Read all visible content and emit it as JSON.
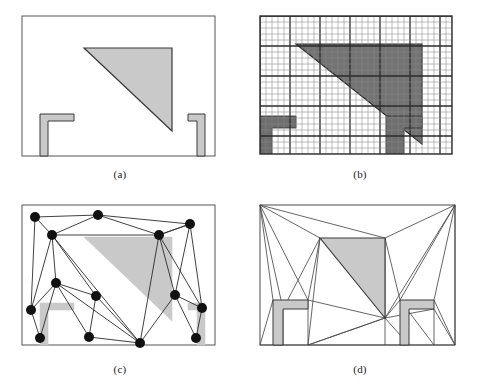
{
  "figure": {
    "background_color": "#ffffff",
    "width": 479,
    "height": 391
  },
  "colors": {
    "outline": "#3a3a3a",
    "border": "#555555",
    "triangle_light_fill": "#c9c9c9",
    "triangle_dark_fill": "#737373",
    "obstacle_light_fill": "#c9c9c9",
    "obstacle_dark_fill": "#6e6e6e",
    "grid_minor": "#8a8a8a",
    "grid_major": "#2b2b2b",
    "node_fill": "#111111",
    "edge_stroke": "#2b2b2b",
    "mesh_stroke": "#4a4a4a"
  },
  "panels": [
    {
      "id": "panel-a",
      "caption": "(a)",
      "name": "continuous-geometry-panel",
      "description": "Original continuous workspace with one triangular obstacle and two L-shaped obstacles",
      "frame": {
        "x": 0,
        "y": 0,
        "width": 240,
        "height": 195
      },
      "box": {
        "x": 22,
        "y": 16,
        "width": 193,
        "height": 140
      },
      "triangle": {
        "points": "84,48 172,48 172,131"
      },
      "obstacles": [
        {
          "name": "left-L-obstacle",
          "points": "40,114 74,114 74,121 48,121 48,156 40,156"
        },
        {
          "name": "right-L-obstacle",
          "points": "188,114 205,114 205,156 197,156 197,121 188,121"
        }
      ]
    },
    {
      "id": "panel-b",
      "caption": "(b)",
      "name": "occupancy-grid-panel",
      "description": "Discretized occupancy grid overlay of the same workspace",
      "frame": {
        "x": 240,
        "y": 0,
        "width": 240,
        "height": 195
      },
      "box": {
        "x": 20,
        "y": 16,
        "width": 192,
        "height": 138
      },
      "grid": {
        "cell_size": 6,
        "major_every": 5,
        "cols": 32,
        "rows": 23
      },
      "triangle": {
        "points": "56,44 182,44 182,144"
      },
      "obstacles": [
        {
          "name": "left-L-obstacle",
          "points": "16,116 56,116 56,128 32,128 32,154 16,154"
        },
        {
          "name": "right-L-obstacle",
          "points": "146,116 182,116 182,128 164,128 164,154 146,154"
        }
      ]
    },
    {
      "id": "panel-c",
      "caption": "(c)",
      "name": "roadmap-graph-panel",
      "description": "Probabilistic roadmap with sampled nodes and connecting edges",
      "frame": {
        "x": 0,
        "y": 195,
        "width": 240,
        "height": 196
      },
      "box": {
        "x": 22,
        "y": 10,
        "width": 193,
        "height": 140
      },
      "node_radius": 5,
      "nodes": [
        {
          "id": 0,
          "x": 35,
          "y": 22
        },
        {
          "id": 1,
          "x": 98,
          "y": 20
        },
        {
          "id": 2,
          "x": 190,
          "y": 29
        },
        {
          "id": 3,
          "x": 52,
          "y": 40
        },
        {
          "id": 4,
          "x": 159,
          "y": 40
        },
        {
          "id": 5,
          "x": 56,
          "y": 88
        },
        {
          "id": 6,
          "x": 96,
          "y": 101
        },
        {
          "id": 7,
          "x": 175,
          "y": 100
        },
        {
          "id": 8,
          "x": 31,
          "y": 115
        },
        {
          "id": 9,
          "x": 202,
          "y": 113
        },
        {
          "id": 10,
          "x": 40,
          "y": 143
        },
        {
          "id": 11,
          "x": 89,
          "y": 142
        },
        {
          "id": 12,
          "x": 140,
          "y": 148
        },
        {
          "id": 13,
          "x": 196,
          "y": 143
        }
      ],
      "edges": [
        [
          0,
          1
        ],
        [
          0,
          3
        ],
        [
          0,
          8
        ],
        [
          1,
          3
        ],
        [
          1,
          4
        ],
        [
          1,
          2
        ],
        [
          2,
          4
        ],
        [
          2,
          7
        ],
        [
          2,
          9
        ],
        [
          3,
          4
        ],
        [
          3,
          5
        ],
        [
          3,
          12
        ],
        [
          3,
          8
        ],
        [
          4,
          7
        ],
        [
          4,
          12
        ],
        [
          4,
          9
        ],
        [
          4,
          2
        ],
        [
          5,
          6
        ],
        [
          5,
          8
        ],
        [
          5,
          10
        ],
        [
          5,
          11
        ],
        [
          5,
          12
        ],
        [
          6,
          11
        ],
        [
          6,
          12
        ],
        [
          7,
          9
        ],
        [
          7,
          12
        ],
        [
          7,
          13
        ],
        [
          8,
          10
        ],
        [
          9,
          13
        ],
        [
          11,
          12
        ],
        [
          6,
          3
        ]
      ],
      "triangle": {
        "points": "84,42 172,42 172,126"
      },
      "obstacles": [
        {
          "name": "left-L-obstacle",
          "points": "40,108 74,108 74,115 48,115 48,150 40,150"
        },
        {
          "name": "right-L-obstacle",
          "points": "188,108 205,108 205,150 197,150 197,115 188,115"
        }
      ]
    },
    {
      "id": "panel-d",
      "caption": "(d)",
      "name": "triangulation-mesh-panel",
      "description": "Constrained triangulation (cell decomposition) of the free space",
      "frame": {
        "x": 240,
        "y": 195,
        "width": 240,
        "height": 196
      },
      "box": {
        "x": 20,
        "y": 10,
        "width": 195,
        "height": 140
      },
      "triangle": {
        "points": "80,43 145,43 145,123"
      },
      "obstacles": [
        {
          "name": "left-L-obstacle",
          "points": "33,105 68,105 68,114 43,114 43,150 33,150"
        },
        {
          "name": "right-L-obstacle",
          "points": "160,105 194,105 194,114 169,114 169,150 160,150"
        }
      ],
      "mesh_edges": [
        [
          20,
          10,
          80,
          43
        ],
        [
          20,
          10,
          145,
          43
        ],
        [
          145,
          43,
          215,
          10
        ],
        [
          20,
          10,
          33,
          105
        ],
        [
          20,
          10,
          43,
          114
        ],
        [
          20,
          10,
          68,
          105
        ],
        [
          80,
          43,
          68,
          105
        ],
        [
          80,
          43,
          43,
          114
        ],
        [
          80,
          43,
          68,
          150
        ],
        [
          33,
          105,
          43,
          150
        ],
        [
          33,
          105,
          20,
          150
        ],
        [
          43,
          114,
          43,
          150
        ],
        [
          20,
          150,
          43,
          150
        ],
        [
          43,
          150,
          68,
          150
        ],
        [
          68,
          105,
          68,
          150
        ],
        [
          68,
          105,
          145,
          123
        ],
        [
          68,
          150,
          145,
          123
        ],
        [
          145,
          123,
          68,
          150
        ],
        [
          145,
          43,
          145,
          123
        ],
        [
          145,
          123,
          160,
          105
        ],
        [
          145,
          123,
          169,
          150
        ],
        [
          145,
          123,
          194,
          114
        ],
        [
          215,
          10,
          194,
          105
        ],
        [
          215,
          10,
          160,
          105
        ],
        [
          215,
          10,
          215,
          150
        ],
        [
          145,
          43,
          160,
          105
        ],
        [
          160,
          105,
          169,
          150
        ],
        [
          194,
          114,
          194,
          150
        ],
        [
          169,
          150,
          194,
          150
        ],
        [
          194,
          150,
          215,
          150
        ],
        [
          194,
          105,
          215,
          150
        ],
        [
          194,
          114,
          215,
          150
        ],
        [
          160,
          105,
          194,
          150
        ],
        [
          68,
          150,
          145,
          150
        ],
        [
          145,
          150,
          169,
          150
        ],
        [
          145,
          123,
          145,
          150
        ],
        [
          215,
          10,
          145,
          123
        ]
      ]
    }
  ]
}
